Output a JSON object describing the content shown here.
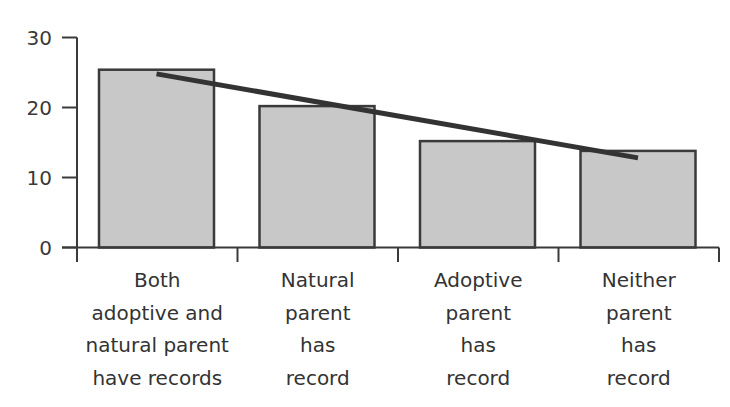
{
  "chart_data": {
    "type": "bar",
    "title": "",
    "xlabel": "",
    "ylabel": "",
    "ylim": [
      0,
      30
    ],
    "yticks": [
      0,
      10,
      20,
      30
    ],
    "grid": false,
    "legend": null,
    "categories": [
      "Both adoptive and natural parent have records",
      "Natural parent has record",
      "Adoptive parent has record",
      "Neither parent has record"
    ],
    "category_label_lines": [
      [
        "Both",
        "adoptive and",
        "natural parent",
        "have records"
      ],
      [
        "Natural",
        "parent",
        "has",
        "record"
      ],
      [
        "Adoptive",
        "parent",
        "has",
        "record"
      ],
      [
        "Neither",
        "parent",
        "has",
        "record"
      ]
    ],
    "values": [
      25.4,
      20.2,
      15.2,
      13.8
    ],
    "trend_line": {
      "type": "line",
      "description": "Linear trend line overlaid on bars",
      "start": {
        "category_index": 0,
        "x_offset": 0.5,
        "value": 24.8
      },
      "end": {
        "category_index": 3,
        "x_offset": 0.5,
        "value": 12.8
      }
    },
    "colors": {
      "bar_fill": "#c8c8c8",
      "bar_stroke": "#3a3a3a",
      "trend_line": "#333333",
      "axis": "#3a3a3a"
    }
  }
}
